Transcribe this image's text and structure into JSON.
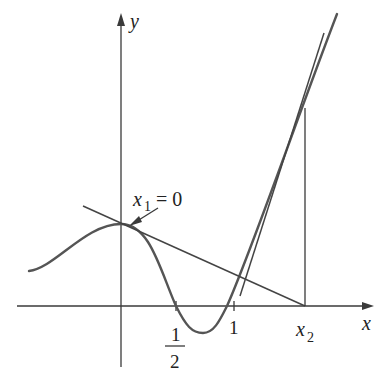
{
  "figure": {
    "type": "newtons-method-failure-diagram",
    "axes": {
      "x_label": "x",
      "y_label": "y"
    },
    "labels": {
      "x1_var": "x",
      "x1_sub": "1",
      "x1_eq": " = 0",
      "x2_var": "x",
      "x2_sub": "2",
      "half_num": "1",
      "half_den": "2",
      "one": "1"
    },
    "colors": {
      "curve": "#555555",
      "lines": "#3a3a3a",
      "background": "#ffffff"
    }
  }
}
